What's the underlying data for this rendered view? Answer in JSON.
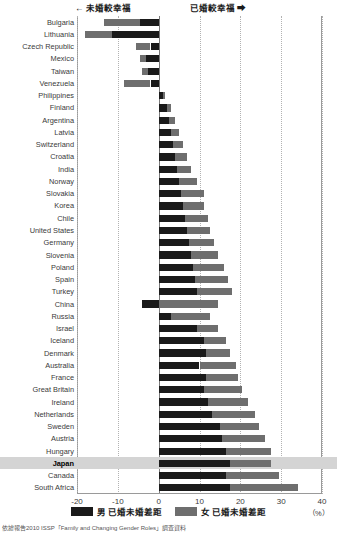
{
  "header": {
    "left_note": "← 未婚較幸福",
    "right_note": "已婚較幸福 ➡"
  },
  "legend": {
    "items": [
      {
        "label": "男 已婚未婚差距",
        "color": "#1a1a1a"
      },
      {
        "label": "女 已婚未婚差距",
        "color": "#6e6e6e"
      }
    ]
  },
  "axis": {
    "unit_label": "（%）",
    "ticks": [
      "-20",
      "-10",
      "0",
      "10",
      "20",
      "30",
      "40"
    ]
  },
  "source": "依據報告2010 ISSP「Family and Changing Gender Roles」調查資料",
  "highlight": {
    "country": "Japan",
    "color": "#d4d4d4"
  },
  "chart_data": {
    "type": "bar",
    "orientation": "horizontal",
    "stacked": true,
    "title": "",
    "xlabel": "（%）",
    "ylabel": "",
    "xlim": [
      -20,
      40
    ],
    "xticks": [
      -20,
      -10,
      0,
      10,
      20,
      30,
      40
    ],
    "grid": "vertical-dotted",
    "legend_position": "bottom-center",
    "annotations": [
      "← 未婚較幸福",
      "已婚較幸福 ➡"
    ],
    "categories": [
      "Bulgaria",
      "Lithuania",
      "Czech Republic",
      "Mexico",
      "Taiwan",
      "Venezuela",
      "Philippines",
      "Finland",
      "Argentina",
      "Latvia",
      "Switzerland",
      "Croatia",
      "India",
      "Norway",
      "Slovakia",
      "Korea",
      "Chile",
      "United States",
      "Germany",
      "Slovenia",
      "Poland",
      "Spain",
      "Turkey",
      "China",
      "Russia",
      "Israel",
      "Iceland",
      "Denmark",
      "Australia",
      "France",
      "Great Britain",
      "Ireland",
      "Netherlands",
      "Sweden",
      "Austria",
      "Hungary",
      "Japan",
      "Canada",
      "South Africa"
    ],
    "series": [
      {
        "name": "男 已婚未婚差距",
        "color": "#1a1a1a",
        "values": [
          -4.5,
          -11.5,
          -2.0,
          -3.0,
          -2.5,
          -2.0,
          1.0,
          2.0,
          2.5,
          3.0,
          3.5,
          4.0,
          4.5,
          5.0,
          5.5,
          6.0,
          6.5,
          7.0,
          7.5,
          8.0,
          8.5,
          9.0,
          9.5,
          -4.0,
          3.0,
          9.5,
          11.0,
          11.5,
          10.0,
          11.5,
          11.0,
          12.0,
          13.0,
          15.0,
          15.5,
          16.5,
          17.5,
          16.5,
          17.5
        ]
      },
      {
        "name": "女 已婚未婚差距",
        "color": "#6e6e6e",
        "values": [
          -9.0,
          -6.5,
          -3.5,
          -1.5,
          -1.5,
          -6.5,
          0.5,
          1.0,
          1.5,
          2.0,
          2.5,
          3.0,
          3.5,
          4.5,
          5.5,
          5.0,
          5.5,
          5.5,
          6.0,
          6.5,
          7.5,
          8.0,
          8.5,
          14.5,
          9.5,
          5.0,
          5.5,
          6.0,
          9.0,
          8.0,
          9.5,
          10.0,
          10.5,
          9.5,
          10.5,
          11.0,
          10.0,
          13.0,
          16.5
        ]
      }
    ]
  }
}
